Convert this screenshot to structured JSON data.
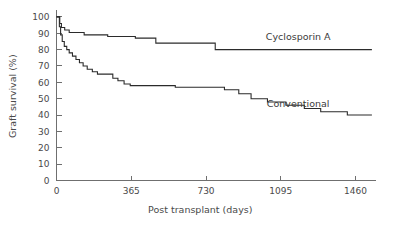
{
  "chart_data": {
    "type": "line",
    "title": "",
    "subtitle": "",
    "xlabel": "Post transplant (days)",
    "ylabel": "Graft survival (%)",
    "xlim": [
      0,
      1560
    ],
    "ylim": [
      0,
      103
    ],
    "grid": false,
    "legend_position": "inline-right",
    "xticks": [
      0,
      365,
      730,
      1095,
      1460
    ],
    "xtick_labels": [
      "0",
      "365",
      "730",
      "1095",
      "1460"
    ],
    "yticks": [
      0,
      10,
      20,
      30,
      40,
      50,
      60,
      70,
      80,
      90,
      100
    ],
    "ytick_labels": [
      "0",
      "10",
      "20",
      "30",
      "40",
      "50",
      "60",
      "70",
      "80",
      "90",
      "100"
    ],
    "step_style": "post",
    "annotations": [
      {
        "text": "Cyclosporin A",
        "x": 1180,
        "y": 86
      },
      {
        "text": "Conventional",
        "x": 1180,
        "y": 45
      }
    ],
    "series": [
      {
        "name": "Cyclosporin A",
        "color": "#2b2b2b",
        "points": [
          {
            "x": 0,
            "y": 100
          },
          {
            "x": 10,
            "y": 100
          },
          {
            "x": 16,
            "y": 96
          },
          {
            "x": 24,
            "y": 93.5
          },
          {
            "x": 40,
            "y": 92
          },
          {
            "x": 62,
            "y": 90.5
          },
          {
            "x": 120,
            "y": 90.5
          },
          {
            "x": 135,
            "y": 89
          },
          {
            "x": 230,
            "y": 89
          },
          {
            "x": 250,
            "y": 88
          },
          {
            "x": 370,
            "y": 88
          },
          {
            "x": 385,
            "y": 87
          },
          {
            "x": 470,
            "y": 87
          },
          {
            "x": 485,
            "y": 84
          },
          {
            "x": 760,
            "y": 84
          },
          {
            "x": 775,
            "y": 80
          },
          {
            "x": 1540,
            "y": 80
          }
        ]
      },
      {
        "name": "Conventional",
        "color": "#2b2b2b",
        "points": [
          {
            "x": 0,
            "y": 100
          },
          {
            "x": 8,
            "y": 100
          },
          {
            "x": 14,
            "y": 94
          },
          {
            "x": 20,
            "y": 89
          },
          {
            "x": 28,
            "y": 85
          },
          {
            "x": 38,
            "y": 82
          },
          {
            "x": 50,
            "y": 80
          },
          {
            "x": 62,
            "y": 78
          },
          {
            "x": 78,
            "y": 76
          },
          {
            "x": 95,
            "y": 74
          },
          {
            "x": 112,
            "y": 72
          },
          {
            "x": 130,
            "y": 70
          },
          {
            "x": 150,
            "y": 68
          },
          {
            "x": 175,
            "y": 66.5
          },
          {
            "x": 200,
            "y": 65
          },
          {
            "x": 255,
            "y": 65
          },
          {
            "x": 275,
            "y": 62.5
          },
          {
            "x": 300,
            "y": 61
          },
          {
            "x": 330,
            "y": 59
          },
          {
            "x": 360,
            "y": 58
          },
          {
            "x": 560,
            "y": 58
          },
          {
            "x": 580,
            "y": 57
          },
          {
            "x": 800,
            "y": 57
          },
          {
            "x": 820,
            "y": 55.5
          },
          {
            "x": 870,
            "y": 55.5
          },
          {
            "x": 890,
            "y": 53
          },
          {
            "x": 930,
            "y": 53
          },
          {
            "x": 950,
            "y": 50
          },
          {
            "x": 1010,
            "y": 50
          },
          {
            "x": 1030,
            "y": 48
          },
          {
            "x": 1100,
            "y": 48
          },
          {
            "x": 1120,
            "y": 46
          },
          {
            "x": 1190,
            "y": 46
          },
          {
            "x": 1210,
            "y": 44
          },
          {
            "x": 1270,
            "y": 44
          },
          {
            "x": 1290,
            "y": 42
          },
          {
            "x": 1400,
            "y": 42
          },
          {
            "x": 1420,
            "y": 40
          },
          {
            "x": 1540,
            "y": 40
          }
        ]
      }
    ]
  }
}
